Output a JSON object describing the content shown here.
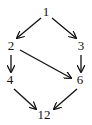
{
  "diagram": {
    "nodes": [
      {
        "id": "1",
        "label": "1",
        "x": 46,
        "y": 16
      },
      {
        "id": "2",
        "label": "2",
        "x": 11,
        "y": 50
      },
      {
        "id": "3",
        "label": "3",
        "x": 81,
        "y": 50
      },
      {
        "id": "4",
        "label": "4",
        "x": 10,
        "y": 84
      },
      {
        "id": "6",
        "label": "6",
        "x": 80,
        "y": 84
      },
      {
        "id": "12",
        "label": "12",
        "x": 44,
        "y": 119
      }
    ],
    "edges": [
      {
        "from": "1",
        "to": "2"
      },
      {
        "from": "1",
        "to": "3"
      },
      {
        "from": "2",
        "to": "4"
      },
      {
        "from": "2",
        "to": "6"
      },
      {
        "from": "3",
        "to": "6"
      },
      {
        "from": "4",
        "to": "12"
      },
      {
        "from": "6",
        "to": "12"
      }
    ],
    "colors": {
      "stroke": "#111111",
      "background": "#ffffff"
    }
  }
}
